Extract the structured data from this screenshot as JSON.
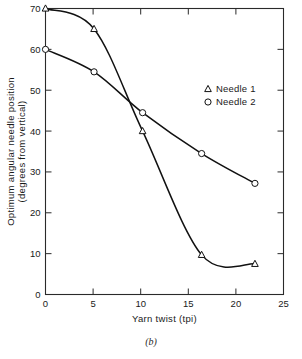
{
  "figure": {
    "caption": "(b)"
  },
  "chart_data": {
    "type": "line",
    "title": "",
    "xlabel": "Yarn twist (tpi)",
    "ylabel": "Optimum angular needle position (degrees from vertical)",
    "ylabel_line1": "Optimum angular needle position",
    "ylabel_line2": "(degrees from vertical)",
    "xlim": [
      0,
      25
    ],
    "ylim": [
      0,
      70
    ],
    "xticks": [
      0,
      5,
      10,
      15,
      20,
      25
    ],
    "yticks": [
      0,
      10,
      20,
      30,
      40,
      50,
      60,
      70
    ],
    "xticklabels": [
      "0",
      "5",
      "10",
      "15",
      "20",
      "25"
    ],
    "yticklabels": [
      "0",
      "10",
      "20",
      "30",
      "40",
      "50",
      "60",
      "70"
    ],
    "grid": false,
    "legend_position": "upper right",
    "frame": "box",
    "tick_direction": "in",
    "series": [
      {
        "name": "Needle 1",
        "marker": "triangle",
        "x": [
          0,
          5.1,
          10.2,
          16.4,
          22.0
        ],
        "values": [
          70.0,
          65.0,
          40.0,
          9.7,
          7.5
        ]
      },
      {
        "name": "Needle 2",
        "marker": "circle",
        "x": [
          0,
          5.1,
          10.2,
          16.4,
          22.0
        ],
        "values": [
          60.0,
          54.5,
          44.5,
          34.5,
          27.2
        ]
      }
    ],
    "legend": [
      {
        "label": "Needle 1",
        "marker": "triangle"
      },
      {
        "label": "Needle 2",
        "marker": "circle"
      }
    ],
    "colors": {
      "curve": "#111111",
      "axis": "#2a2a2a",
      "background": "#ffffff"
    }
  }
}
